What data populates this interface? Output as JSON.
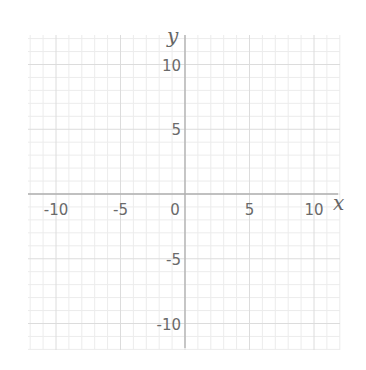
{
  "chart_data": {
    "type": "scatter",
    "title": "",
    "xlabel": "x",
    "ylabel": "y",
    "xlim": [
      -12,
      12
    ],
    "ylim": [
      -12,
      12
    ],
    "x_ticks": [
      -10,
      -5,
      0,
      5,
      10
    ],
    "y_ticks": [
      -10,
      -5,
      5,
      10
    ],
    "x_tick_labels": [
      "-10",
      "-5",
      "0",
      "5",
      "10"
    ],
    "y_tick_labels": [
      "-10",
      "-5",
      "5",
      "10"
    ],
    "grid": true,
    "minor_grid_step": 1,
    "major_grid_step": 5,
    "series": [],
    "colors": {
      "axis": "#b0b0b0",
      "major_grid": "#dcdcdc",
      "minor_grid": "#ececec",
      "text": "#6a6a6a"
    }
  }
}
